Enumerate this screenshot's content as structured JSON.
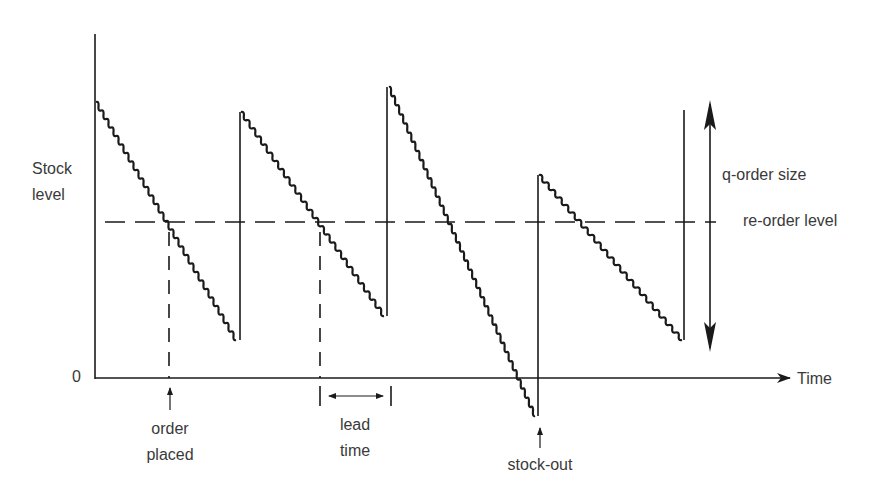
{
  "chart_data": {
    "type": "line",
    "title": "",
    "xlabel": "Time",
    "ylabel": "Stock level",
    "y_origin_label": "0",
    "reference_lines": [
      {
        "name": "re-order level",
        "style": "dashed",
        "orientation": "horizontal"
      }
    ],
    "series": [
      {
        "name": "Stock level",
        "style": "stepped-declining sawtooth",
        "cycles": [
          {
            "start": [
              0,
              0.85
            ],
            "end": [
              0.2,
              0.12
            ],
            "replenished_to": 0.82
          },
          {
            "start": [
              0.2,
              0.82
            ],
            "end": [
              0.42,
              0.19
            ],
            "replenished_to": 0.9
          },
          {
            "start": [
              0.42,
              0.9
            ],
            "end": [
              0.64,
              -0.12
            ],
            "replenished_to": 0.62,
            "note": "stock-out"
          },
          {
            "start": [
              0.64,
              0.62
            ],
            "end": [
              0.86,
              0.12
            ],
            "replenished_to": 0.81
          }
        ]
      }
    ],
    "annotations": [
      {
        "text": "order placed",
        "type": "arrow-up",
        "at": "first crossing of re-order level"
      },
      {
        "text": "lead time",
        "type": "double-arrow-interval",
        "at": "between order and replenishment in cycle 2"
      },
      {
        "text": "stock-out",
        "type": "arrow-up",
        "at": "minimum of cycle 3 below zero"
      },
      {
        "text": "q-order size",
        "type": "double-arrow-vertical",
        "at": "right side"
      },
      {
        "text": "re-order level",
        "type": "label",
        "at": "right end of dashed line"
      }
    ],
    "grid": false,
    "legend": "none"
  },
  "labels": {
    "y_axis": [
      "Stock",
      "level"
    ],
    "origin": "0",
    "x_axis": "Time",
    "q_order_size": "q-order size",
    "reorder_level": "re-order level",
    "order_placed": [
      "order",
      "placed"
    ],
    "lead_time": [
      "lead",
      "time"
    ],
    "stock_out": "stock-out"
  },
  "colors": {
    "ink": "#1a1a1a",
    "text": "#3a3a3a",
    "background": "#ffffff"
  }
}
